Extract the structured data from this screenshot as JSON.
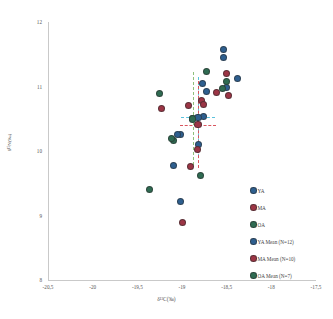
{
  "chart_data": {
    "type": "scatter",
    "title": "",
    "xlabel": "δ¹³C(‰)",
    "ylabel": "δ¹⁵N(‰)",
    "xlim": [
      -20.5,
      -17.5
    ],
    "ylim": [
      8,
      12
    ],
    "xticks": [
      "-20,5",
      "-20",
      "-19,5",
      "-19",
      "-18,5",
      "-18",
      "-17,5"
    ],
    "yticks": [
      "12",
      "11",
      "10",
      "9",
      "8"
    ],
    "grid": false,
    "legend_position": "inside-bottom-right",
    "series": [
      {
        "name": "YA",
        "color": "#2e5f8f",
        "points": [
          [
            -18.54,
            11.57
          ],
          [
            -18.53,
            11.45
          ],
          [
            -18.38,
            11.12
          ],
          [
            -18.5,
            10.98
          ],
          [
            -18.73,
            10.92
          ],
          [
            -18.77,
            11.05
          ],
          [
            -18.76,
            10.53
          ],
          [
            -19.02,
            10.26
          ],
          [
            -19.05,
            10.25
          ],
          [
            -18.81,
            10.1
          ],
          [
            -19.09,
            9.78
          ],
          [
            -19.02,
            9.22
          ]
        ]
      },
      {
        "name": "MA",
        "color": "#9c3545",
        "points": [
          [
            -18.5,
            11.2
          ],
          [
            -18.61,
            10.9
          ],
          [
            -18.48,
            10.86
          ],
          [
            -18.78,
            10.79
          ],
          [
            -18.76,
            10.72
          ],
          [
            -18.93,
            10.7
          ],
          [
            -19.23,
            10.66
          ],
          [
            -18.83,
            10.03
          ],
          [
            -18.9,
            9.76
          ],
          [
            -18.99,
            8.89
          ]
        ]
      },
      {
        "name": "OA",
        "color": "#2f6b52",
        "points": [
          [
            -18.73,
            11.23
          ],
          [
            -18.5,
            11.08
          ],
          [
            -19.25,
            10.89
          ],
          [
            -18.88,
            10.5
          ],
          [
            -18.55,
            10.97
          ],
          [
            -19.1,
            10.17
          ],
          [
            -19.12,
            10.2
          ],
          [
            -18.79,
            9.62
          ],
          [
            -19.36,
            9.4
          ]
        ]
      }
    ],
    "means": [
      {
        "name": "YA Mean (N=12)",
        "color": "#2e5f8f",
        "x": -18.82,
        "y": 10.52,
        "xerr": 0.19,
        "yerr": 0.62,
        "error_color": "#5bc2dd"
      },
      {
        "name": "MA Mean (N=10)",
        "color": "#9c3545",
        "x": -18.82,
        "y": 10.41,
        "xerr": 0.2,
        "yerr": 0.68,
        "error_color": "#d9565f"
      },
      {
        "name": "OA Mean (N=7)",
        "color": "#2f6b52",
        "x": -18.88,
        "y": 10.5,
        "xerr": 0.0,
        "yerr": 0.72,
        "error_color": "#8fbf7a"
      }
    ]
  },
  "legend": {
    "items": [
      {
        "label": "YA",
        "color": "#2e5f8f"
      },
      {
        "label": "MA",
        "color": "#9c3545"
      },
      {
        "label": "OA",
        "color": "#2f6b52"
      },
      {
        "label": "YA Mean (N=12)",
        "color": "#2e5f8f"
      },
      {
        "label": "MA Mean (N=10)",
        "color": "#9c3545"
      },
      {
        "label": "OA Mean (N=7)",
        "color": "#2f6b52"
      }
    ]
  }
}
